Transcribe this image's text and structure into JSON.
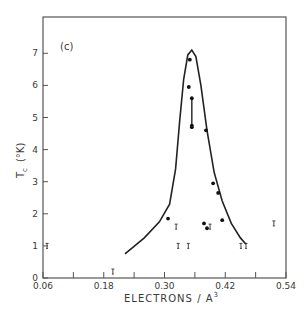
{
  "chart_data": {
    "type": "scatter",
    "title": "",
    "panel_label": "(c)",
    "xlabel": "ELECTRONS / A",
    "xlabel_superscript": "3",
    "ylabel": "T",
    "ylabel_subscript": "c",
    "ylabel_unit": "(°K)",
    "xlim": [
      0.06,
      0.54
    ],
    "ylim": [
      0,
      8
    ],
    "x_ticks": [
      0.06,
      0.12,
      0.18,
      0.24,
      0.3,
      0.36,
      0.42,
      0.48,
      0.54
    ],
    "x_tick_labels": [
      "0.06",
      "",
      "0.18",
      "",
      "0.30",
      "",
      "0.42",
      "",
      "0.54"
    ],
    "y_ticks": [
      0,
      1,
      2,
      3,
      4,
      5,
      6,
      7
    ],
    "y_tick_labels": [
      "0",
      "1",
      "2",
      "3",
      "4",
      "5",
      "6",
      "7"
    ],
    "grid": false,
    "legend": "none",
    "series": [
      {
        "name": "measured Tc",
        "marker": "filled-circle",
        "points": [
          {
            "x": 0.35,
            "y": 6.8
          },
          {
            "x": 0.348,
            "y": 5.95
          },
          {
            "x": 0.354,
            "y": 5.6
          },
          {
            "x": 0.354,
            "y": 4.75
          },
          {
            "x": 0.354,
            "y": 4.7
          },
          {
            "x": 0.382,
            "y": 4.6
          },
          {
            "x": 0.396,
            "y": 2.95
          },
          {
            "x": 0.406,
            "y": 2.65
          },
          {
            "x": 0.307,
            "y": 1.85
          },
          {
            "x": 0.414,
            "y": 1.8
          },
          {
            "x": 0.378,
            "y": 1.7
          },
          {
            "x": 0.384,
            "y": 1.55
          }
        ],
        "error_bars": [
          {
            "x": 0.354,
            "y_low": 4.7,
            "y_high": 5.6
          }
        ]
      },
      {
        "name": "upper limit / not superconducting above",
        "marker": "tick-bar",
        "points": [
          {
            "x": 0.068,
            "y": 1.0
          },
          {
            "x": 0.198,
            "y": 0.2
          },
          {
            "x": 0.323,
            "y": 1.6
          },
          {
            "x": 0.39,
            "y": 1.6
          },
          {
            "x": 0.327,
            "y": 1.0
          },
          {
            "x": 0.347,
            "y": 1.0
          },
          {
            "x": 0.451,
            "y": 1.0
          },
          {
            "x": 0.461,
            "y": 1.0
          },
          {
            "x": 0.516,
            "y": 1.7
          }
        ]
      },
      {
        "name": "envelope curve",
        "type": "line",
        "points": [
          {
            "x": 0.222,
            "y": 0.75
          },
          {
            "x": 0.26,
            "y": 1.25
          },
          {
            "x": 0.29,
            "y": 1.75
          },
          {
            "x": 0.31,
            "y": 2.3
          },
          {
            "x": 0.322,
            "y": 3.4
          },
          {
            "x": 0.33,
            "y": 4.9
          },
          {
            "x": 0.338,
            "y": 6.2
          },
          {
            "x": 0.346,
            "y": 6.95
          },
          {
            "x": 0.354,
            "y": 7.1
          },
          {
            "x": 0.362,
            "y": 6.9
          },
          {
            "x": 0.372,
            "y": 6.0
          },
          {
            "x": 0.384,
            "y": 4.6
          },
          {
            "x": 0.398,
            "y": 3.3
          },
          {
            "x": 0.414,
            "y": 2.4
          },
          {
            "x": 0.432,
            "y": 1.7
          },
          {
            "x": 0.45,
            "y": 1.25
          },
          {
            "x": 0.461,
            "y": 1.05
          }
        ]
      }
    ]
  }
}
